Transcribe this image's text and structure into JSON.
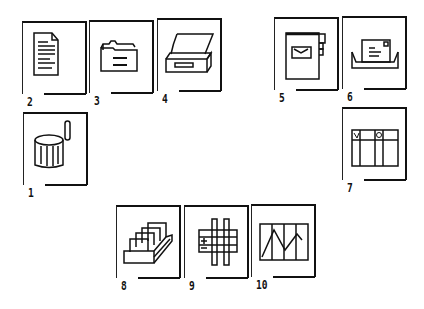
{
  "icons": [
    {
      "number": "2",
      "name": "document",
      "x": 22,
      "y": 21
    },
    {
      "number": "3",
      "name": "folder",
      "x": 89,
      "y": 20
    },
    {
      "number": "4",
      "name": "printer",
      "x": 157,
      "y": 18
    },
    {
      "number": "5",
      "name": "mailbox",
      "x": 274,
      "y": 17
    },
    {
      "number": "6",
      "name": "in-tray",
      "x": 342,
      "y": 16
    },
    {
      "number": "1",
      "name": "wastebasket",
      "x": 23,
      "y": 112
    },
    {
      "number": "7",
      "name": "table",
      "x": 342,
      "y": 107
    },
    {
      "number": "8",
      "name": "card-file",
      "x": 116,
      "y": 205
    },
    {
      "number": "9",
      "name": "spreadsheet",
      "x": 184,
      "y": 205
    },
    {
      "number": "10",
      "name": "chart",
      "x": 251,
      "y": 204
    }
  ]
}
